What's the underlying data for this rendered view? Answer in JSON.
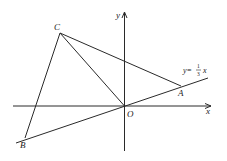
{
  "diagram": {
    "type": "coordinate-geometry",
    "axes": {
      "x_label": "x",
      "y_label": "y",
      "origin_label": "O"
    },
    "points": {
      "A": {
        "label": "A"
      },
      "B": {
        "label": "B"
      },
      "C": {
        "label": "C"
      },
      "O": {
        "label": "O"
      }
    },
    "line_equation": {
      "prefix": "y=",
      "numerator": "1",
      "denominator": "3",
      "suffix": "x"
    },
    "segments": [
      "CA",
      "CO",
      "CB",
      "line y=1/3x through B, O, A"
    ],
    "stroke_color": "#2a2a2a"
  }
}
